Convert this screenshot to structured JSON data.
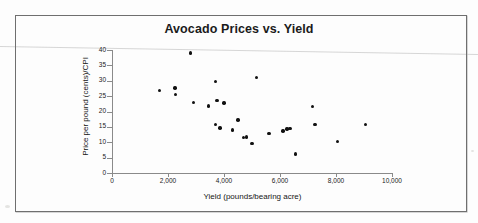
{
  "figure": {
    "title": "Avocado Prices vs. Yield",
    "border_color": "#6f6f6f"
  },
  "chart_data": {
    "type": "scatter",
    "title": "Avocado Prices vs. Yield",
    "xlabel": "Yield (pounds/bearing acre)",
    "ylabel": "Price per pound (cents)/CPI",
    "xlim": [
      0,
      10000
    ],
    "ylim": [
      0,
      40
    ],
    "xticks": [
      0,
      2000,
      4000,
      6000,
      8000,
      10000
    ],
    "xtick_labels": [
      "0",
      "2,000",
      "4,000",
      "6,000",
      "8,000",
      "10,000"
    ],
    "yticks": [
      0,
      5,
      10,
      15,
      20,
      25,
      30,
      35,
      40
    ],
    "ytick_labels": [
      "0",
      "5",
      "10",
      "15",
      "20",
      "25",
      "30",
      "35",
      "40"
    ],
    "grid": false,
    "legend": false,
    "marker": "filled-circle",
    "marker_color": "#111111",
    "points": [
      {
        "x": 1700,
        "y": 26.8
      },
      {
        "x": 2250,
        "y": 27.6
      },
      {
        "x": 2270,
        "y": 25.6
      },
      {
        "x": 2800,
        "y": 39.0
      },
      {
        "x": 2900,
        "y": 23.0
      },
      {
        "x": 3450,
        "y": 21.8
      },
      {
        "x": 3700,
        "y": 29.8
      },
      {
        "x": 3750,
        "y": 23.6
      },
      {
        "x": 3700,
        "y": 15.8
      },
      {
        "x": 3850,
        "y": 14.7
      },
      {
        "x": 4000,
        "y": 22.8
      },
      {
        "x": 4300,
        "y": 14.0
      },
      {
        "x": 4500,
        "y": 17.3
      },
      {
        "x": 4700,
        "y": 11.5
      },
      {
        "x": 4800,
        "y": 11.7
      },
      {
        "x": 5000,
        "y": 9.6
      },
      {
        "x": 5150,
        "y": 31.0
      },
      {
        "x": 5600,
        "y": 12.8
      },
      {
        "x": 6100,
        "y": 13.6
      },
      {
        "x": 6250,
        "y": 14.3
      },
      {
        "x": 6350,
        "y": 14.4
      },
      {
        "x": 6550,
        "y": 6.2
      },
      {
        "x": 7150,
        "y": 21.6
      },
      {
        "x": 7250,
        "y": 15.8
      },
      {
        "x": 8050,
        "y": 10.2
      },
      {
        "x": 9050,
        "y": 15.7
      }
    ]
  }
}
